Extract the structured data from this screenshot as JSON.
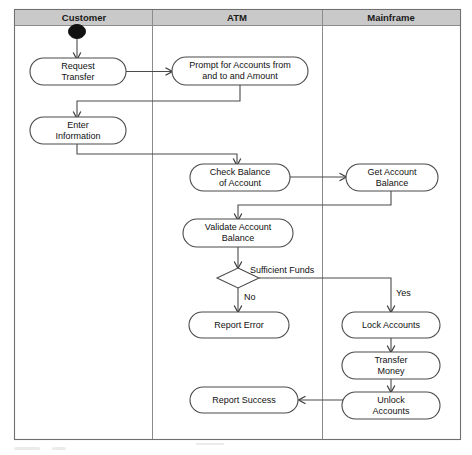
{
  "diagram": {
    "type": "uml-activity-diagram-with-swimlanes",
    "lanes": [
      {
        "id": "customer",
        "label": "Customer"
      },
      {
        "id": "atm",
        "label": "ATM"
      },
      {
        "id": "mainframe",
        "label": "Mainframe"
      }
    ],
    "nodes": [
      {
        "id": "start",
        "kind": "initial-node",
        "lane": "customer",
        "label": ""
      },
      {
        "id": "request-transfer",
        "kind": "activity",
        "lane": "customer",
        "label_line1": "Request",
        "label_line2": "Transfer"
      },
      {
        "id": "prompt-for-accounts",
        "kind": "activity",
        "lane": "atm",
        "label_line1": "Prompt for Accounts from",
        "label_line2": "and to and Amount"
      },
      {
        "id": "enter-information",
        "kind": "activity",
        "lane": "customer",
        "label_line1": "Enter",
        "label_line2": "Information"
      },
      {
        "id": "check-balance",
        "kind": "activity",
        "lane": "atm",
        "label_line1": "Check Balance",
        "label_line2": "of Account"
      },
      {
        "id": "get-account-balance",
        "kind": "activity",
        "lane": "mainframe",
        "label_line1": "Get Account",
        "label_line2": "Balance"
      },
      {
        "id": "validate-account-balance",
        "kind": "activity",
        "lane": "atm",
        "label_line1": "Validate Account",
        "label_line2": "Balance"
      },
      {
        "id": "sufficient-funds",
        "kind": "decision",
        "lane": "atm",
        "label": "Sufficient Funds"
      },
      {
        "id": "report-error",
        "kind": "activity",
        "lane": "atm",
        "label_line1": "Report Error",
        "label_line2": ""
      },
      {
        "id": "lock-accounts",
        "kind": "activity",
        "lane": "mainframe",
        "label_line1": "Lock Accounts",
        "label_line2": ""
      },
      {
        "id": "transfer-money",
        "kind": "activity",
        "lane": "mainframe",
        "label_line1": "Transfer",
        "label_line2": "Money"
      },
      {
        "id": "unlock-accounts",
        "kind": "activity",
        "lane": "mainframe",
        "label_line1": "Unlock",
        "label_line2": "Accounts"
      },
      {
        "id": "report-success",
        "kind": "activity",
        "lane": "atm",
        "label_line1": "Report Success",
        "label_line2": ""
      }
    ],
    "edge_labels": {
      "no_branch": "No",
      "yes_branch": "Yes"
    },
    "colors": {
      "lane_header_fill": "#c9c9c9",
      "frame_stroke": "#6f6f6f",
      "node_stroke": "#4a4a4a",
      "edge_stroke": "#4a4a4a",
      "text": "#111111",
      "background": "#ffffff",
      "start_node_fill": "#111111"
    }
  }
}
